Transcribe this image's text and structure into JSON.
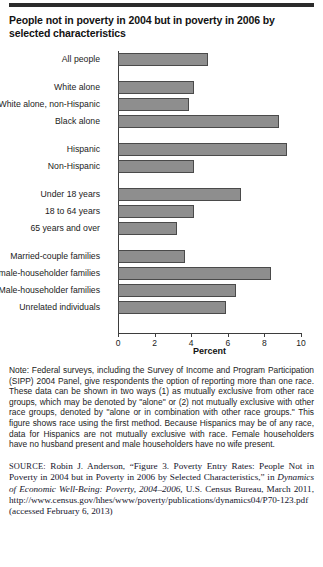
{
  "title": "People not in poverty in 2004 but in poverty in 2006 by selected characteristics",
  "chart_data": {
    "type": "bar",
    "orientation": "horizontal",
    "title": "People not in poverty in 2004 but in poverty in 2006 by selected characteristics",
    "xlabel": "Percent",
    "ylabel": "",
    "xlim": [
      0,
      10
    ],
    "xticks": [
      0,
      2,
      4,
      6,
      8,
      10
    ],
    "grid": false,
    "legend": "none",
    "bar_color": "#8e8e8e",
    "bar_edge_color": "#4a4a4a",
    "categories": [
      "All people",
      "White alone",
      "White alone, non-Hispanic",
      "Black alone",
      "Hispanic",
      "Non-Hispanic",
      "Under 18 years",
      "18 to 64 years",
      "65 years and over",
      "Married-couple families",
      "Female-householder families",
      "Male-householder families",
      "Unrelated individuals"
    ],
    "values": [
      4.6,
      3.9,
      3.6,
      8.2,
      8.6,
      3.9,
      6.3,
      3.9,
      3.0,
      3.4,
      7.8,
      6.0,
      5.5
    ],
    "group_breaks_before": [
      1,
      4,
      6,
      9
    ]
  },
  "note": "Note: Federal surveys, including the Survey of Income and Program Participation (SIPP) 2004 Panel, give respondents the option of reporting more than one race. These data can be shown in two ways (1) as mutually exclusive from other race groups, which may be denoted by \"alone\" or (2) not mutually exclusive with other race groups, denoted by \"alone or in combination with other race groups.\" This figure shows race using the first method. Because Hispanics may be of any race, data for Hispanics are not mutually exclusive with race. Female householders have no husband present and male householders have no wife present.",
  "source": {
    "label": "SOURCE:",
    "part1": " Robin J. Anderson, “Figure 3. Poverty Entry Rates: People Not in Poverty in 2004 but in Poverty in 2006 by Selected Characteristics,” in ",
    "italic": "Dynamics of Economic Well-Being: Poverty, 2004–2006,",
    "part2": " U.S. Census Bureau, March 2011, http://www.census.gov/hhes/www/poverty/publications/dynamics04/P70-123.pdf (accessed February 6, 2013)"
  }
}
